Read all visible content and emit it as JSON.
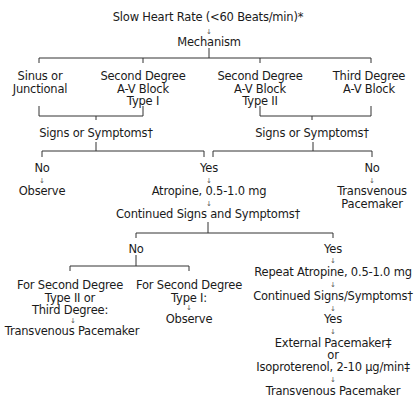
{
  "title": "Slow Heart Rate (<60 Beats/min)*",
  "mechanism": "Mechanism",
  "causes": [
    {
      "line1": "Sinus or",
      "line2": "Junctional"
    },
    {
      "line1": "Second Degree",
      "line2": "A-V Block",
      "line3": "Type I"
    },
    {
      "line1": "Second Degree",
      "line2": "A-V Block",
      "line3": "Type II"
    },
    {
      "line1": "Third Degree",
      "line2": "A-V Block"
    }
  ],
  "left_branch": {
    "question": "Signs or Symptoms†",
    "no": "No",
    "no_action": "Observe",
    "yes": "Yes"
  },
  "right_branch": {
    "question": "Signs or Symptoms†",
    "no": "No",
    "no_action_line1": "Transvenous",
    "no_action_line2": "Pacemaker"
  },
  "atropine": "Atropine, 0.5-1.0 mg",
  "continued": "Continued Signs and Symptoms†",
  "continued_no": {
    "label": "No",
    "option1": {
      "line1": "For Second Degree",
      "line2": "Type II or",
      "line3": "Third Degree:",
      "action": "Transvenous Pacemaker"
    },
    "option2": {
      "line1": "For Second Degree",
      "line2": "Type I:",
      "action": "Observe"
    }
  },
  "continued_yes": {
    "label": "Yes",
    "repeat": "Repeat Atropine, 0.5-1.0 mg",
    "continued2": "Continued Signs/Symptoms†",
    "yes2": "Yes",
    "external": "External Pacemaker‡",
    "or": "or",
    "isoproterenol": "Isoproterenol, 2-10 μg/min‡",
    "final": "Transvenous Pacemaker"
  },
  "arrow": "↓"
}
